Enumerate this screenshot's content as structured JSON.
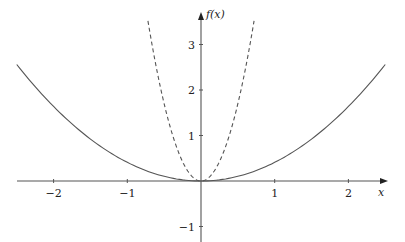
{
  "chart_data": {
    "type": "line",
    "title": "",
    "xlabel": "x",
    "ylabel": "f(x)",
    "xlim": [
      -2.5,
      2.5
    ],
    "ylim": [
      -1,
      3.5
    ],
    "grid": false,
    "legend": null,
    "x_ticks": [
      -2,
      -1,
      1,
      2
    ],
    "x_tick_labels": [
      "−2",
      "−1",
      "1",
      "2"
    ],
    "y_ticks": [
      -1,
      1,
      2,
      3
    ],
    "y_tick_labels": [
      "−1",
      "1",
      "2",
      "3"
    ],
    "series": [
      {
        "name": "solid parabola",
        "style": "solid",
        "color": "#555555",
        "formula": "≈0.41·x²",
        "x": [
          -2.5,
          -2,
          -1.5,
          -1,
          -0.5,
          0,
          0.5,
          1,
          1.5,
          2,
          2.5
        ],
        "y": [
          2.56,
          1.64,
          0.92,
          0.41,
          0.1,
          0,
          0.1,
          0.41,
          0.92,
          1.64,
          2.56
        ]
      },
      {
        "name": "dashed parabola",
        "style": "dashed",
        "color": "#555555",
        "formula": "≈6.8·x²",
        "x": [
          -0.72,
          -0.6,
          -0.4,
          -0.2,
          0,
          0.2,
          0.4,
          0.6,
          0.72
        ],
        "y": [
          3.52,
          2.45,
          1.09,
          0.27,
          0,
          0.27,
          1.09,
          2.45,
          3.52
        ]
      }
    ]
  }
}
